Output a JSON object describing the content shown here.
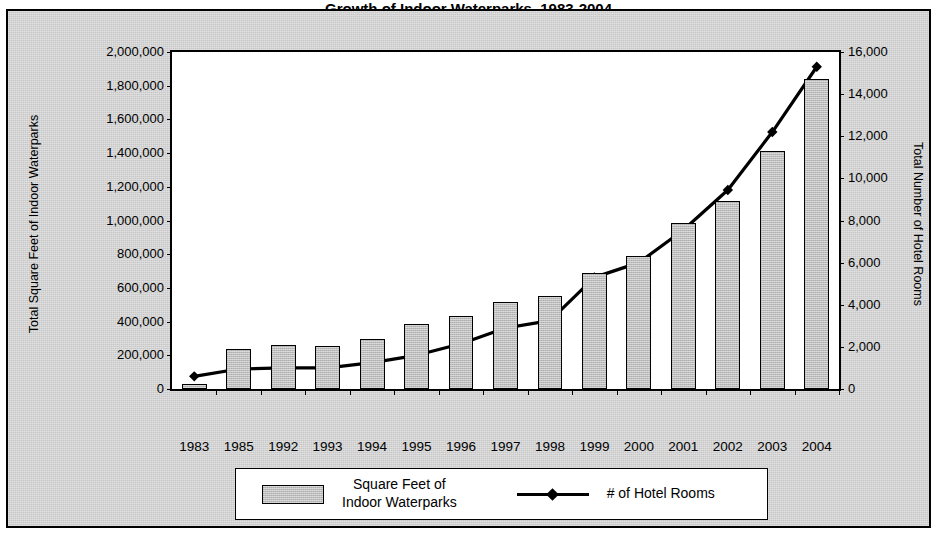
{
  "title": "Growth of Indoor Waterparks, 1983-2004",
  "legend": {
    "bar_label_line1": "Square Feet of",
    "bar_label_line2": "Indoor Waterparks",
    "line_label": "# of Hotel Rooms"
  },
  "axes": {
    "left_title": "Total Square Feet of Indoor Waterparks",
    "right_title": "Total Number of Hotel Rooms",
    "left_ticks": [
      "0",
      "200,000",
      "400,000",
      "600,000",
      "800,000",
      "1,000,000",
      "1,200,000",
      "1,400,000",
      "1,600,000",
      "1,800,000",
      "2,000,000"
    ],
    "right_ticks": [
      "0",
      "2,000",
      "4,000",
      "6,000",
      "8,000",
      "10,000",
      "12,000",
      "14,000",
      "16,000"
    ]
  },
  "chart_data": {
    "type": "bar",
    "title": "Growth of Indoor Waterparks, 1983-2004",
    "xlabel": "",
    "ylabel": "Total Square Feet of Indoor Waterparks",
    "y2label": "Total Number of Hotel Rooms",
    "ylim": [
      0,
      2000000
    ],
    "y2lim": [
      0,
      16000
    ],
    "grid": false,
    "legend_position": "bottom",
    "categories": [
      "1983",
      "1985",
      "1992",
      "1993",
      "1994",
      "1995",
      "1996",
      "1997",
      "1998",
      "1999",
      "2000",
      "2001",
      "2002",
      "2003",
      "2004"
    ],
    "series": [
      {
        "name": "Square Feet of Indoor Waterparks",
        "type": "bar",
        "axis": "left",
        "values": [
          30000,
          240000,
          260000,
          258000,
          295000,
          385000,
          435000,
          515000,
          550000,
          690000,
          790000,
          985000,
          1115000,
          1415000,
          1840000
        ]
      },
      {
        "name": "# of Hotel Rooms",
        "type": "line",
        "axis": "right",
        "marker": "diamond",
        "values": [
          600,
          950,
          1000,
          1000,
          1250,
          1600,
          2150,
          2900,
          3250,
          5300,
          6000,
          7550,
          9450,
          12200,
          15300
        ]
      }
    ]
  }
}
